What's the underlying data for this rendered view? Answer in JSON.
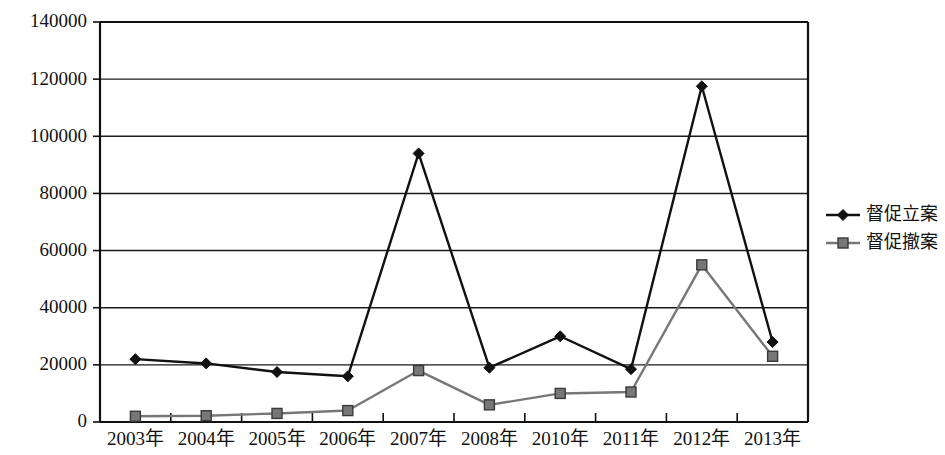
{
  "chart_data": {
    "type": "line",
    "title": "",
    "subtitle": "",
    "xlabel": "",
    "ylabel": "",
    "categories": [
      "2003年",
      "2004年",
      "2005年",
      "2006年",
      "2007年",
      "2008年",
      "2010年",
      "2011年",
      "2012年",
      "2013年"
    ],
    "series": [
      {
        "name": "督促立案",
        "marker": "diamond",
        "color": "#111111",
        "values": [
          22000,
          20500,
          17500,
          16000,
          94000,
          19000,
          30000,
          18500,
          117500,
          28000
        ]
      },
      {
        "name": "督促撤案",
        "marker": "square",
        "color": "#777777",
        "values": [
          2000,
          2200,
          3000,
          4000,
          18000,
          6000,
          10000,
          10500,
          55000,
          23000
        ]
      }
    ],
    "ylim": [
      0,
      140000
    ],
    "ytick_step": 20000,
    "yticks": [
      0,
      20000,
      40000,
      60000,
      80000,
      100000,
      120000,
      140000
    ],
    "ytick_labels": [
      "0",
      "20000",
      "40000",
      "60000",
      "80000",
      "100000",
      "120000",
      "140000"
    ],
    "grid": true,
    "grid_axis": "y",
    "legend_position": "right",
    "legend": [
      "督促立案",
      "督促撤案"
    ]
  },
  "colors": {
    "series1": "#111111",
    "series2": "#777777",
    "grid": "#1a1a1a",
    "axis": "#111111",
    "background": "#ffffff"
  }
}
